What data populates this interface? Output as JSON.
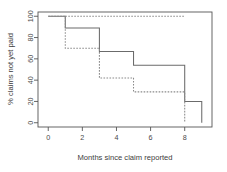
{
  "chart_data": {
    "type": "line",
    "title": "",
    "subtitle": "",
    "xlabel": "Months since claim reported",
    "ylabel": "% claims not yet paid",
    "xlim": [
      -0.6,
      9.6
    ],
    "ylim": [
      -4,
      104
    ],
    "xticks": [
      0,
      2,
      4,
      6,
      8
    ],
    "xticklabels": [
      "0",
      "2",
      "4",
      "6",
      "8"
    ],
    "yticks": [
      0,
      20,
      40,
      60,
      80,
      100
    ],
    "yticklabels": [
      "0",
      "20",
      "40",
      "60",
      "80",
      "100"
    ],
    "grid": false,
    "legend": "none",
    "box": true,
    "drawstyle": "steps-post",
    "series": [
      {
        "name": "solid",
        "style": "solid",
        "color": "#6b6b6b",
        "x": [
          0,
          1,
          1,
          3,
          3,
          5,
          5,
          8,
          8,
          9,
          9
        ],
        "y": [
          100,
          100,
          89,
          89,
          67,
          67,
          54,
          54,
          20,
          20,
          0
        ]
      },
      {
        "name": "dashed",
        "style": "dashed",
        "color": "#8a8a8a",
        "x": [
          0,
          1,
          1,
          3,
          3,
          5,
          5,
          8,
          8
        ],
        "y": [
          100,
          100,
          70,
          70,
          42,
          42,
          29,
          29,
          0
        ]
      },
      {
        "name": "dashed-top",
        "style": "dashed",
        "color": "#8a8a8a",
        "x": [
          1,
          8
        ],
        "y": [
          100,
          100
        ]
      }
    ]
  },
  "labels": {
    "xlabel": "Months since claim reported",
    "ylabel": "% claims not yet paid"
  }
}
